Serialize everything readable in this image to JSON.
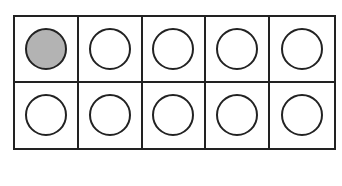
{
  "ten_frame": {
    "rows": 2,
    "columns": 5,
    "filled_count": 1,
    "total_cells": 10,
    "filled_color": "#b3b3b3",
    "empty_color": "#ffffff",
    "line_color": "#222222",
    "cells": [
      {
        "row": 1,
        "col": 1,
        "filled": true
      },
      {
        "row": 1,
        "col": 2,
        "filled": false
      },
      {
        "row": 1,
        "col": 3,
        "filled": false
      },
      {
        "row": 1,
        "col": 4,
        "filled": false
      },
      {
        "row": 1,
        "col": 5,
        "filled": false
      },
      {
        "row": 2,
        "col": 1,
        "filled": false
      },
      {
        "row": 2,
        "col": 2,
        "filled": false
      },
      {
        "row": 2,
        "col": 3,
        "filled": false
      },
      {
        "row": 2,
        "col": 4,
        "filled": false
      },
      {
        "row": 2,
        "col": 5,
        "filled": false
      }
    ]
  }
}
